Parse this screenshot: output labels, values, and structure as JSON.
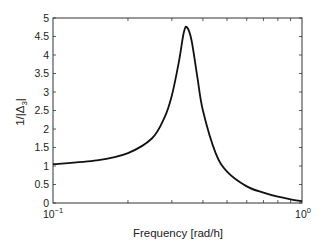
{
  "chart_data": {
    "type": "line",
    "title": "",
    "xlabel": "Frequency [rad/h]",
    "ylabel": "1/|Δ3|",
    "xscale": "log",
    "xlim": [
      0.1,
      1.0
    ],
    "ylim": [
      0,
      5
    ],
    "x_ticks": [
      "10^-1",
      "10^0"
    ],
    "y_ticks": [
      "0",
      "0.5",
      "1",
      "1.5",
      "2",
      "2.5",
      "3",
      "3.5",
      "4",
      "4.5",
      "5"
    ],
    "grid": false,
    "legend": null,
    "series": [
      {
        "name": "1/|Δ3|",
        "x": [
          0.1,
          0.15,
          0.2,
          0.25,
          0.28,
          0.3,
          0.32,
          0.335,
          0.345,
          0.36,
          0.38,
          0.4,
          0.45,
          0.5,
          0.6,
          0.7,
          0.8,
          0.9,
          1.0
        ],
        "values": [
          1.05,
          1.15,
          1.35,
          1.75,
          2.3,
          2.9,
          3.8,
          4.6,
          4.75,
          4.4,
          3.4,
          2.5,
          1.35,
          0.85,
          0.45,
          0.28,
          0.17,
          0.1,
          0.05
        ]
      }
    ]
  },
  "axes": {
    "xlabel": "Frequency [rad/h]",
    "ylabel_main": "1/|Δ",
    "ylabel_sub": "3",
    "ylabel_end": "|",
    "x_tick_base": "10",
    "x_tick_exp_left": "−1",
    "x_tick_exp_right": "0"
  }
}
